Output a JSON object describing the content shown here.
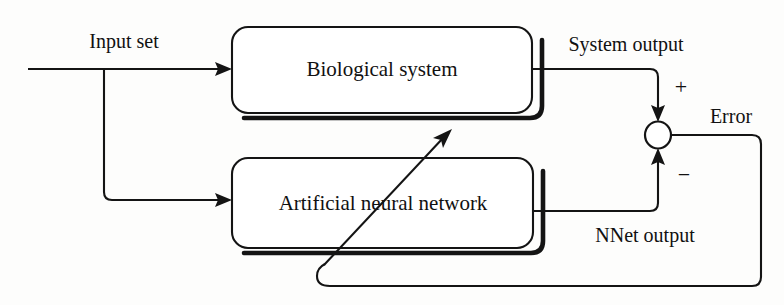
{
  "diagram": {
    "background_color": "#fdfdfc",
    "line_color": "#141414",
    "blocks": [
      {
        "id": "biological-system",
        "label": "Biological system"
      },
      {
        "id": "artificial-neural-network",
        "label": "Artificial neural network"
      }
    ],
    "labels": {
      "input_set": "Input set",
      "system_output": "System output",
      "nnet_output": "NNet output",
      "error": "Error",
      "plus_sign": "+",
      "minus_sign": "−"
    },
    "junction": {
      "name": "summing-junction",
      "shape": "circle",
      "plus_input": "System output",
      "minus_input": "NNet output",
      "output": "Error"
    }
  }
}
